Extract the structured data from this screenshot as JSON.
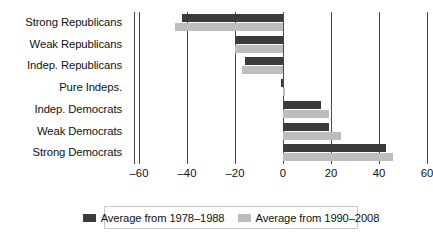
{
  "chart_data": {
    "type": "bar",
    "orientation": "horizontal",
    "title": "",
    "xlabel": "",
    "ylabel": "",
    "xlim": [
      -60,
      60
    ],
    "xticks": [
      -60,
      -40,
      -20,
      0,
      20,
      40,
      60
    ],
    "xtick_labels": [
      "–60",
      "–40",
      "–20",
      "0",
      "20",
      "40",
      "60"
    ],
    "grid": "vertical",
    "legend_position": "bottom",
    "categories": [
      "Strong Republicans",
      "Weak Republicans",
      "Indep. Republicans",
      "Pure Indeps.",
      "Indep. Democrats",
      "Weak Democrats",
      "Strong Democrats"
    ],
    "series": [
      {
        "name": "Average from 1978–1988",
        "color": "#3b3b3b",
        "values": [
          -42,
          -20,
          -16,
          -1,
          16,
          19,
          43
        ]
      },
      {
        "name": "Average from 1990–2008",
        "color": "#bdbdbd",
        "values": [
          -45,
          -20,
          -17,
          1,
          19,
          24,
          46
        ]
      }
    ]
  },
  "legend": {
    "items": [
      {
        "label": "Average from 1978–1988",
        "swatch": "dark"
      },
      {
        "label": "Average from 1990–2008",
        "swatch": "light"
      }
    ]
  }
}
